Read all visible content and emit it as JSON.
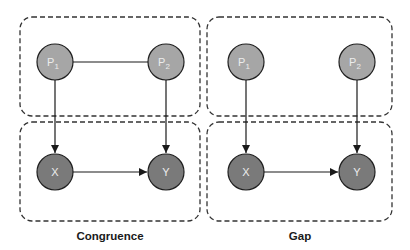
{
  "colors": {
    "box_stroke": "#333333",
    "edge": "#1a1a1a",
    "p_fill": "#a6a6a6",
    "xy_fill": "#7a7a7a",
    "node_stroke": "#1f1f1f",
    "node_text": "#ececec",
    "caption": "#1a1a1a"
  },
  "panels": [
    {
      "caption": "Congruence",
      "nodes": {
        "p1": {
          "base": "P",
          "sub": "1"
        },
        "p2": {
          "base": "P",
          "sub": "2"
        },
        "x": {
          "label": "X"
        },
        "y": {
          "label": "Y"
        }
      },
      "edges": [
        "P1—P2 (undirected)",
        "P1→X",
        "P2→Y",
        "X→Y"
      ]
    },
    {
      "caption": "Gap",
      "nodes": {
        "p1": {
          "base": "P",
          "sub": "1"
        },
        "p2": {
          "base": "P",
          "sub": "2"
        },
        "x": {
          "label": "X"
        },
        "y": {
          "label": "Y"
        }
      },
      "edges": [
        "P1→X",
        "P2→Y",
        "X→Y"
      ]
    }
  ]
}
